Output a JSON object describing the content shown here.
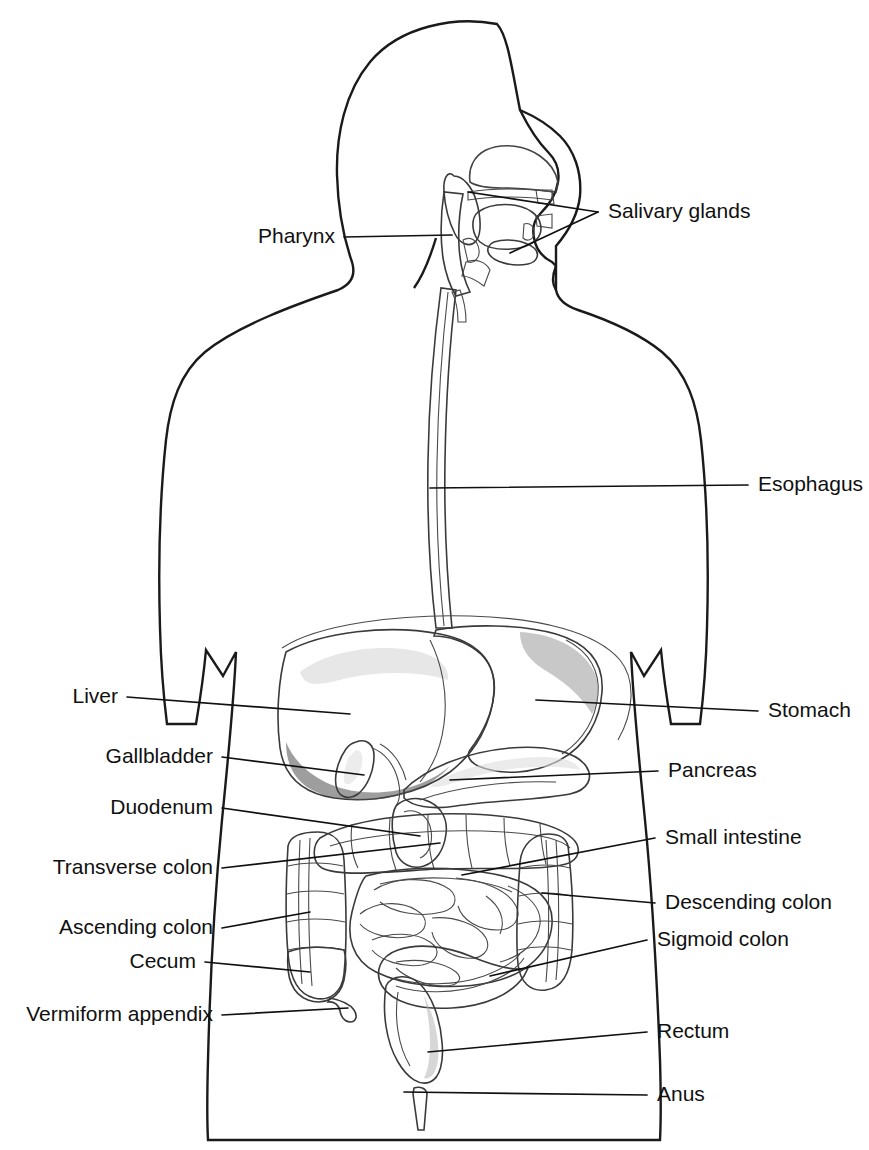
{
  "colors": {
    "background": "#ffffff",
    "body_silhouette": "#d2d2d2",
    "body_outline": "#1a1a1a",
    "organ_light": "#cfcfcf",
    "organ_mid": "#b4b4b4",
    "organ_dark": "#8a8a8a",
    "liver_dark": "#707070",
    "label_text": "#101010",
    "leader_line": "#101010"
  },
  "labels": {
    "left": [
      {
        "id": "pharynx",
        "text": "Pharynx",
        "text_x": 335,
        "text_y": 237
      },
      {
        "id": "liver",
        "text": "Liver",
        "text_x": 118,
        "text_y": 697
      },
      {
        "id": "gallbladder",
        "text": "Gallbladder",
        "text_x": 213,
        "text_y": 757
      },
      {
        "id": "duodenum",
        "text": "Duodenum",
        "text_x": 213,
        "text_y": 808
      },
      {
        "id": "transverse-colon",
        "text": "Transverse colon",
        "text_x": 213,
        "text_y": 868
      },
      {
        "id": "ascending-colon",
        "text": "Ascending colon",
        "text_x": 213,
        "text_y": 928
      },
      {
        "id": "cecum",
        "text": "Cecum",
        "text_x": 196,
        "text_y": 962
      },
      {
        "id": "vermiform-appendix",
        "text": "Vermiform appendix",
        "text_x": 213,
        "text_y": 1015
      }
    ],
    "right": [
      {
        "id": "salivary-glands",
        "text": "Salivary glands",
        "text_x": 608,
        "text_y": 212
      },
      {
        "id": "esophagus",
        "text": "Esophagus",
        "text_x": 758,
        "text_y": 485
      },
      {
        "id": "stomach",
        "text": "Stomach",
        "text_x": 768,
        "text_y": 711
      },
      {
        "id": "pancreas",
        "text": "Pancreas",
        "text_x": 668,
        "text_y": 771
      },
      {
        "id": "small-intestine",
        "text": "Small intestine",
        "text_x": 665,
        "text_y": 838
      },
      {
        "id": "descending-colon",
        "text": "Descending colon",
        "text_x": 665,
        "text_y": 903
      },
      {
        "id": "sigmoid-colon",
        "text": "Sigmoid colon",
        "text_x": 657,
        "text_y": 940
      },
      {
        "id": "rectum",
        "text": "Rectum",
        "text_x": 657,
        "text_y": 1032
      },
      {
        "id": "anus",
        "text": "Anus",
        "text_x": 657,
        "text_y": 1095
      }
    ]
  },
  "structures": [
    {
      "id": "salivary-glands",
      "name": "Salivary glands"
    },
    {
      "id": "pharynx",
      "name": "Pharynx"
    },
    {
      "id": "esophagus",
      "name": "Esophagus"
    },
    {
      "id": "stomach",
      "name": "Stomach"
    },
    {
      "id": "liver",
      "name": "Liver"
    },
    {
      "id": "gallbladder",
      "name": "Gallbladder"
    },
    {
      "id": "pancreas",
      "name": "Pancreas"
    },
    {
      "id": "duodenum",
      "name": "Duodenum"
    },
    {
      "id": "small-intestine",
      "name": "Small intestine"
    },
    {
      "id": "transverse-colon",
      "name": "Transverse colon"
    },
    {
      "id": "ascending-colon",
      "name": "Ascending colon"
    },
    {
      "id": "descending-colon",
      "name": "Descending colon"
    },
    {
      "id": "cecum",
      "name": "Cecum"
    },
    {
      "id": "vermiform-appendix",
      "name": "Vermiform appendix"
    },
    {
      "id": "sigmoid-colon",
      "name": "Sigmoid colon"
    },
    {
      "id": "rectum",
      "name": "Rectum"
    },
    {
      "id": "anus",
      "name": "Anus"
    }
  ]
}
